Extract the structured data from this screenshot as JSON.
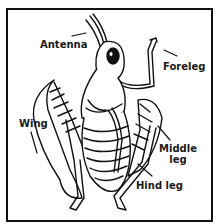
{
  "diagram": {
    "labels": {
      "antenna": "Antenna",
      "foreleg": "Foreleg",
      "wing": "Wing",
      "middle_leg_1": "Middle",
      "middle_leg_2": "leg",
      "hind_leg": "Hind leg"
    },
    "colors": {
      "line": "#111111",
      "background": "#ffffff"
    }
  }
}
